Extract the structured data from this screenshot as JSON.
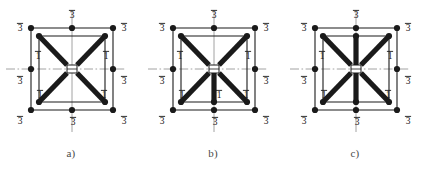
{
  "figure": {
    "background": "#ffffff",
    "ink": "#1a1a1a",
    "caption_color": "#4a4a4a",
    "width": 426,
    "height": 173
  },
  "labels": {
    "three_bar": "3",
    "one_bar": "1"
  },
  "panels": [
    {
      "id": "panel-a",
      "caption": "a)",
      "offset_x": 0,
      "node_labels": {
        "top_left": "3",
        "top_mid": "3",
        "top_right": "3",
        "mid_left": "3",
        "mid_right": "3",
        "bottom_left": "3",
        "bottom_mid": "3",
        "bottom_right": "3"
      },
      "inner_labels": [
        {
          "name": "upper-left-one",
          "text": "1",
          "x": 32,
          "y": 57
        },
        {
          "name": "upper-right-one",
          "text": "1",
          "x": 100,
          "y": 57
        },
        {
          "name": "lower-left-one",
          "text": "1",
          "x": 34,
          "y": 96
        },
        {
          "name": "lower-right-one",
          "text": "1",
          "x": 98,
          "y": 96
        }
      ],
      "has_vertical_upper_spoke": false,
      "has_vertical_lower_spoke": false
    },
    {
      "id": "panel-b",
      "caption": "b)",
      "offset_x": 142,
      "node_labels": {
        "top_left": "3",
        "top_mid": "3",
        "top_right": "3",
        "mid_left": "3",
        "mid_right": "3",
        "bottom_left": "3",
        "bottom_mid": "3",
        "bottom_right": "3"
      },
      "inner_labels": [
        {
          "name": "upper-left-one",
          "text": "1",
          "x": 32,
          "y": 57
        },
        {
          "name": "upper-right-one",
          "text": "1",
          "x": 100,
          "y": 57
        },
        {
          "name": "lower-left-one",
          "text": "1",
          "x": 34,
          "y": 96
        },
        {
          "name": "lower-center-one",
          "text": "1",
          "x": 71,
          "y": 96
        },
        {
          "name": "lower-right-one",
          "text": "1",
          "x": 98,
          "y": 96
        }
      ],
      "has_vertical_upper_spoke": false,
      "has_vertical_lower_spoke": true
    },
    {
      "id": "panel-c",
      "caption": "c)",
      "offset_x": 284,
      "node_labels": {
        "top_left": "3",
        "top_mid": "3",
        "top_right": "3",
        "mid_left": "3",
        "mid_right": "3",
        "bottom_left": "3",
        "bottom_mid": "3",
        "bottom_right": "3"
      },
      "inner_labels": [
        {
          "name": "upper-left-one",
          "text": "1",
          "x": 32,
          "y": 57
        },
        {
          "name": "upper-right-one",
          "text": "1",
          "x": 100,
          "y": 57
        },
        {
          "name": "lower-left-one",
          "text": "1",
          "x": 34,
          "y": 96
        },
        {
          "name": "lower-right-one",
          "text": "1",
          "x": 98,
          "y": 96
        }
      ],
      "has_vertical_upper_spoke": true,
      "has_vertical_lower_spoke": true
    }
  ],
  "geometry": {
    "outer_left": 25,
    "outer_right": 107,
    "outer_top": 28,
    "outer_bottom": 110,
    "inner_left": 33,
    "inner_right": 99,
    "inner_top": 36,
    "inner_bottom": 102,
    "center_x": 66,
    "center_y": 69,
    "axis_h_left": 6,
    "axis_h_right": 126,
    "axis_v_top": 10,
    "axis_v_bottom": 132,
    "hub_half_w": 5,
    "hub_half_h": 4,
    "node_radius": 3.1,
    "thick_width": 5.2,
    "thin_width": 1.1
  }
}
